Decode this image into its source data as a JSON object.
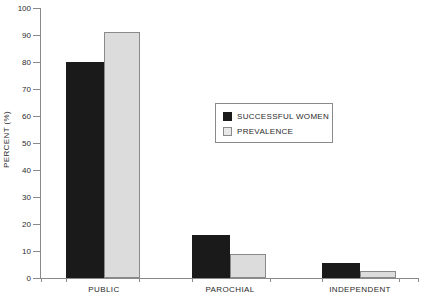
{
  "chart_data": {
    "type": "bar",
    "title": "",
    "xlabel": "",
    "ylabel": "PERCENT (%)",
    "ylim": [
      0,
      100
    ],
    "ytick_step": 10,
    "yticks": [
      0,
      10,
      20,
      30,
      40,
      50,
      60,
      70,
      80,
      90,
      100
    ],
    "ytick_labels": [
      "0",
      "10",
      "20",
      "30",
      "40",
      "50",
      "60",
      "70",
      "80",
      "90",
      "100"
    ],
    "categories": [
      "PUBLIC",
      "PAROCHIAL",
      "INDEPENDENT"
    ],
    "series": [
      {
        "name": "SUCCESSFUL WOMEN",
        "color": "#1a1a1a",
        "edge_color": "#1a1a1a",
        "values": [
          80,
          16,
          5.5
        ]
      },
      {
        "name": "PREVALENCE",
        "color": "#dcdcdc",
        "edge_color": "#8a8a8a",
        "values": [
          91,
          9,
          2.5
        ]
      }
    ],
    "grid": false,
    "legend_position": "center",
    "legend_entries": [
      "SUCCESSFUL WOMEN",
      "PREVALENCE"
    ],
    "axis_color": "#8a8a8a",
    "background": "#ffffff"
  }
}
